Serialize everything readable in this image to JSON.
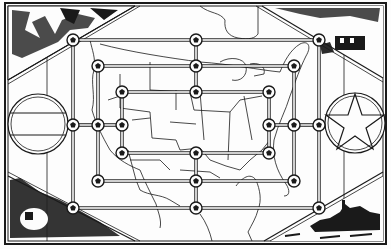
{
  "game": {
    "title": "Mill board on United States map",
    "type": "nine-mens-morris",
    "colors": {
      "ink": "#1a1a1a",
      "paper": "#fdfdfd",
      "shade": "#2b2b2b"
    }
  },
  "board": {
    "rings": [
      {
        "name": "outer",
        "x": [
          73,
          196,
          319
        ],
        "y": [
          40,
          125,
          208
        ]
      },
      {
        "name": "middle",
        "x": [
          98,
          196,
          294
        ],
        "y": [
          66,
          125,
          181
        ]
      },
      {
        "name": "inner",
        "x": [
          122,
          196,
          269
        ],
        "y": [
          92,
          125,
          153
        ]
      }
    ],
    "points": [
      {
        "id": "a1",
        "x": 73,
        "y": 40
      },
      {
        "id": "a2",
        "x": 196,
        "y": 40
      },
      {
        "id": "a3",
        "x": 319,
        "y": 40
      },
      {
        "id": "b1",
        "x": 98,
        "y": 66
      },
      {
        "id": "b2",
        "x": 196,
        "y": 66
      },
      {
        "id": "b3",
        "x": 294,
        "y": 66
      },
      {
        "id": "c1",
        "x": 122,
        "y": 92
      },
      {
        "id": "c2",
        "x": 196,
        "y": 92
      },
      {
        "id": "c3",
        "x": 269,
        "y": 92
      },
      {
        "id": "d1",
        "x": 73,
        "y": 125
      },
      {
        "id": "d2",
        "x": 98,
        "y": 125
      },
      {
        "id": "d3",
        "x": 122,
        "y": 125
      },
      {
        "id": "d4",
        "x": 269,
        "y": 125
      },
      {
        "id": "d5",
        "x": 294,
        "y": 125
      },
      {
        "id": "d6",
        "x": 319,
        "y": 125
      },
      {
        "id": "e1",
        "x": 122,
        "y": 153
      },
      {
        "id": "e2",
        "x": 196,
        "y": 153
      },
      {
        "id": "e3",
        "x": 269,
        "y": 153
      },
      {
        "id": "f1",
        "x": 98,
        "y": 181
      },
      {
        "id": "f2",
        "x": 196,
        "y": 181
      },
      {
        "id": "f3",
        "x": 294,
        "y": 181
      },
      {
        "id": "g1",
        "x": 73,
        "y": 208
      },
      {
        "id": "g2",
        "x": 196,
        "y": 208
      },
      {
        "id": "g3",
        "x": 319,
        "y": 208
      }
    ]
  },
  "decorations": {
    "left_emblem": "striped-shield-circle",
    "right_emblem": "star-circle",
    "corner_top_left": "soldiers-scene",
    "corner_top_right": "building-landscape-scene",
    "corner_bottom_left": "explosion-scene",
    "corner_bottom_right": "battleship-scene"
  }
}
